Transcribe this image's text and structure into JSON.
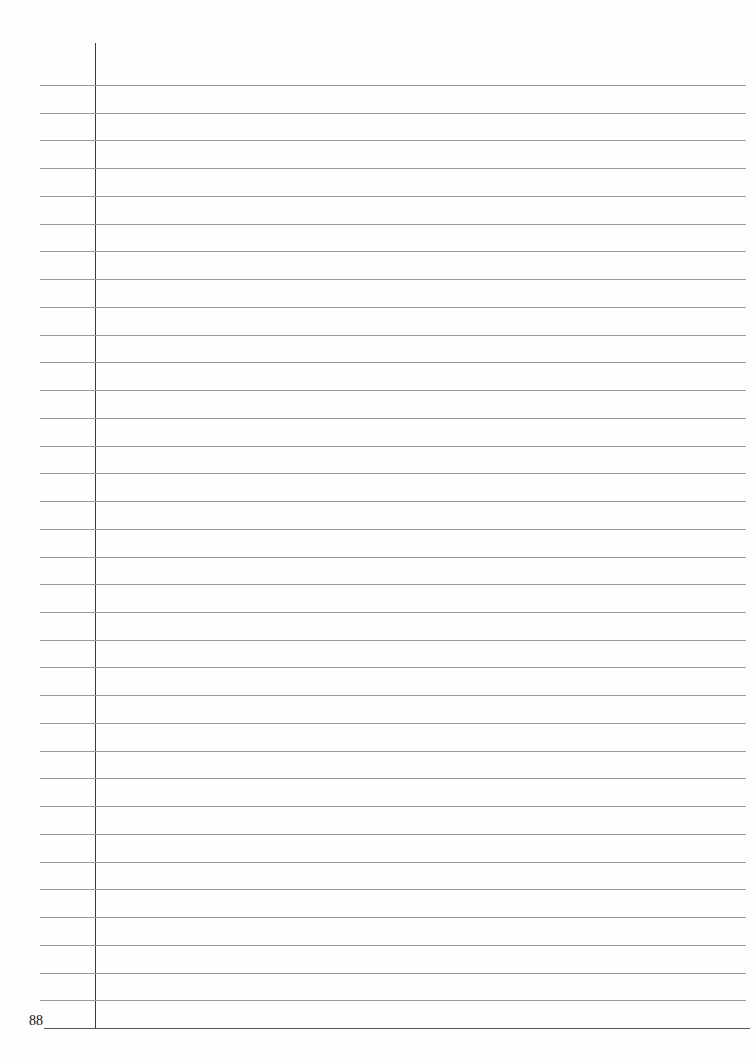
{
  "page": {
    "type": "lined-notebook-page",
    "page_number": "88",
    "rule_count": 35,
    "colors": {
      "background": "#fefefe",
      "rule": "#9a9a9a",
      "margin_line": "#3a3a3a",
      "text": "#111111"
    }
  }
}
